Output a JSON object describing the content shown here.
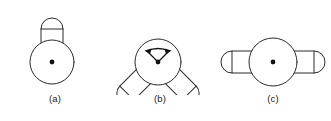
{
  "diagram": {
    "background_color": "#ffffff",
    "stroke_color": "#2b2b2b",
    "pivot_color": "#111111",
    "figures": [
      {
        "id": "a",
        "caption": "(a)",
        "description": "Hub circle with a single vertical capsule arm pointing up",
        "hub": {
          "cx": 52,
          "cy": 62,
          "r": 22
        },
        "pivot_dot": {
          "cx": 52,
          "cy": 62,
          "r": 2.4
        },
        "arms": [
          {
            "name": "arm-up",
            "angle_deg": 90,
            "length": 42,
            "width": 22,
            "cap": "rounded"
          }
        ],
        "arrow": null
      },
      {
        "id": "b",
        "caption": "(b)",
        "description": "Hub circle with two capsule arms at plus and minus forty-five degrees and a double-headed swing arrow",
        "hub": {
          "cx": 58,
          "cy": 62,
          "r": 23
        },
        "pivot_dot": {
          "cx": 58,
          "cy": 62,
          "r": 2.4
        },
        "arms": [
          {
            "name": "arm-upper-left",
            "angle_deg": 135,
            "length": 44,
            "width": 20,
            "cap": "rounded"
          },
          {
            "name": "arm-upper-right",
            "angle_deg": 45,
            "length": 44,
            "width": 20,
            "cap": "rounded"
          }
        ],
        "arrow": {
          "name": "swing-range-arrow",
          "type": "double-headed",
          "span_deg": 90,
          "radius": 14
        }
      },
      {
        "id": "c",
        "caption": "(c)",
        "description": "Hub circle with two horizontal capsule arms pointing left and right",
        "hub": {
          "cx": 58,
          "cy": 62,
          "r": 24
        },
        "pivot_dot": {
          "cx": 58,
          "cy": 62,
          "r": 2.4
        },
        "arms": [
          {
            "name": "arm-left",
            "angle_deg": 180,
            "length": 45,
            "width": 22,
            "cap": "rounded"
          },
          {
            "name": "arm-right",
            "angle_deg": 0,
            "length": 45,
            "width": 22,
            "cap": "rounded"
          }
        ],
        "arrow": null
      }
    ]
  }
}
